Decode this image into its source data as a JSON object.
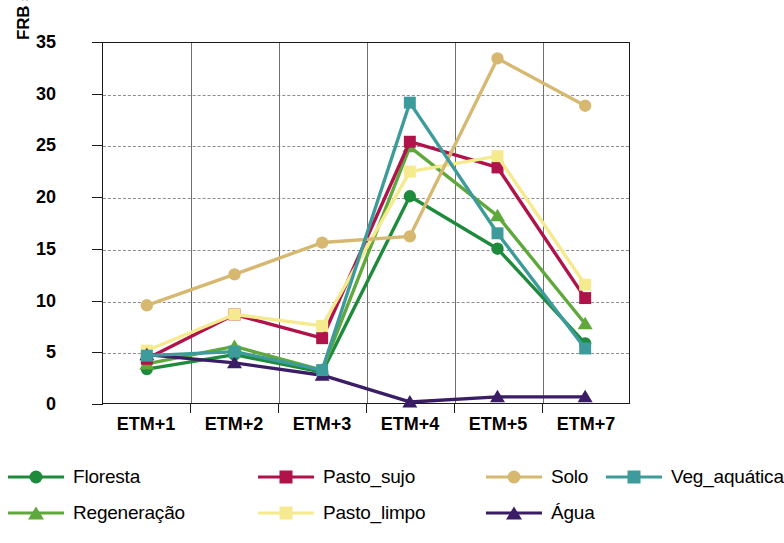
{
  "chart_data": {
    "type": "line",
    "title": "",
    "xlabel": "",
    "ylabel": "FRB superfície (%)",
    "categories": [
      "ETM+1",
      "ETM+2",
      "ETM+3",
      "ETM+4",
      "ETM+5",
      "ETM+7"
    ],
    "ylim": [
      0,
      35
    ],
    "yticks": [
      0,
      5,
      10,
      15,
      20,
      25,
      30,
      35
    ],
    "grid": true,
    "legend_position": "bottom",
    "series": [
      {
        "name": "Floresta",
        "color": "#1e8b3c",
        "marker": "circle",
        "values": [
          3.3,
          4.7,
          3.0,
          20.1,
          15.0,
          5.8
        ]
      },
      {
        "name": "Regeneração",
        "color": "#5fa83b",
        "marker": "triangle",
        "values": [
          3.8,
          5.5,
          3.2,
          24.9,
          18.2,
          7.7
        ]
      },
      {
        "name": "Pasto_sujo",
        "color": "#b0134a",
        "marker": "square",
        "values": [
          4.3,
          8.6,
          6.3,
          25.4,
          22.9,
          10.2
        ]
      },
      {
        "name": "Pasto_limpo",
        "color": "#f5ea8e",
        "marker": "square",
        "values": [
          5.1,
          8.6,
          7.5,
          22.5,
          24.0,
          11.5
        ]
      },
      {
        "name": "Solo",
        "color": "#d6b870",
        "marker": "circle",
        "values": [
          9.5,
          12.5,
          15.6,
          16.2,
          33.5,
          28.9
        ]
      },
      {
        "name": "Água",
        "color": "#3b1d66",
        "marker": "triangle",
        "values": [
          4.7,
          3.9,
          2.7,
          0.1,
          0.6,
          0.6
        ]
      },
      {
        "name": "Veg_aquática",
        "color": "#3d9b9b",
        "marker": "square",
        "values": [
          4.6,
          5.0,
          3.2,
          29.2,
          16.5,
          5.3
        ]
      }
    ]
  },
  "legend": {
    "items": [
      {
        "label": "Floresta"
      },
      {
        "label": "Regeneração"
      },
      {
        "label": "Pasto_sujo"
      },
      {
        "label": "Pasto_limpo"
      },
      {
        "label": "Solo"
      },
      {
        "label": "Água"
      },
      {
        "label": "Veg_aquática"
      }
    ]
  }
}
